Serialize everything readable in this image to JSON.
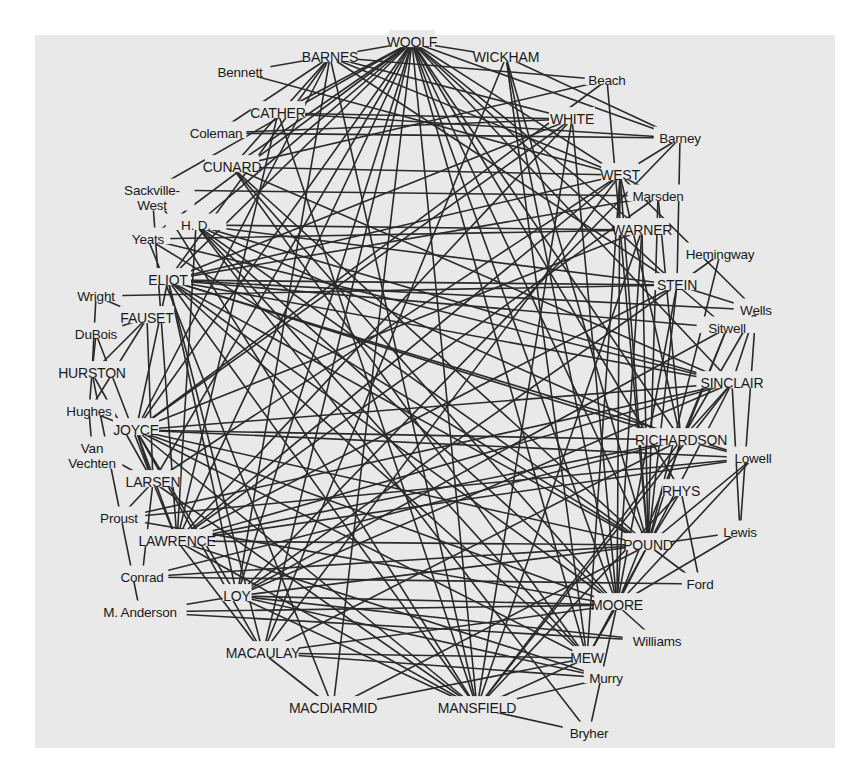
{
  "diagram": {
    "colors": {
      "background": "#ffffff",
      "panel": "#e9e9e9",
      "line": "#2a2a2a",
      "text": "#1a1a1a"
    },
    "nodes": [
      {
        "id": "woolf",
        "label": "WOOLF",
        "x": 412,
        "y": 42,
        "major": true
      },
      {
        "id": "barnes",
        "label": "BARNES",
        "x": 330,
        "y": 57,
        "major": true
      },
      {
        "id": "wickham",
        "label": "WICKHAM",
        "x": 506,
        "y": 57,
        "major": true
      },
      {
        "id": "bennett",
        "label": "Bennett",
        "x": 240,
        "y": 72,
        "major": false
      },
      {
        "id": "beach",
        "label": "Beach",
        "x": 607,
        "y": 80,
        "major": false
      },
      {
        "id": "cather",
        "label": "CATHER",
        "x": 278,
        "y": 113,
        "major": true
      },
      {
        "id": "white",
        "label": "WHITE",
        "x": 572,
        "y": 119,
        "major": true
      },
      {
        "id": "coleman",
        "label": "Coleman",
        "x": 216,
        "y": 133,
        "major": false
      },
      {
        "id": "barney",
        "label": "Barney",
        "x": 680,
        "y": 138,
        "major": false
      },
      {
        "id": "cunard",
        "label": "CUNARD",
        "x": 232,
        "y": 167,
        "major": true
      },
      {
        "id": "west",
        "label": "WEST",
        "x": 620,
        "y": 175,
        "major": true
      },
      {
        "id": "sackville",
        "label": "Sackville-",
        "label2": "West",
        "x": 152,
        "y": 190,
        "major": false
      },
      {
        "id": "marsden",
        "label": "Marsden",
        "x": 658,
        "y": 196,
        "major": false
      },
      {
        "id": "hd",
        "label": "H.   D.",
        "x": 196,
        "y": 225,
        "major": false
      },
      {
        "id": "warner",
        "label": "WARNER",
        "x": 642,
        "y": 230,
        "major": true
      },
      {
        "id": "yeats",
        "label": "Yeats",
        "x": 148,
        "y": 239,
        "major": false
      },
      {
        "id": "hemingway",
        "label": "Hemingway",
        "x": 720,
        "y": 254,
        "major": false
      },
      {
        "id": "eliot",
        "label": "ELIOT",
        "x": 168,
        "y": 280,
        "major": true
      },
      {
        "id": "stein",
        "label": "STEIN",
        "x": 677,
        "y": 285,
        "major": true
      },
      {
        "id": "wright",
        "label": "Wright",
        "x": 96,
        "y": 296,
        "major": false
      },
      {
        "id": "wells",
        "label": "Wells",
        "x": 756,
        "y": 310,
        "major": false
      },
      {
        "id": "fauset",
        "label": "FAUSET",
        "x": 147,
        "y": 318,
        "major": true
      },
      {
        "id": "sitwell",
        "label": "Sitwell",
        "x": 727,
        "y": 328,
        "major": false
      },
      {
        "id": "dubois",
        "label": "DuBois",
        "x": 96,
        "y": 334,
        "major": false
      },
      {
        "id": "hurston",
        "label": "HURSTON",
        "x": 92,
        "y": 373,
        "major": true
      },
      {
        "id": "sinclair",
        "label": "SINCLAIR",
        "x": 732,
        "y": 383,
        "major": true
      },
      {
        "id": "hughes",
        "label": "Hughes",
        "x": 89,
        "y": 411,
        "major": false
      },
      {
        "id": "joyce",
        "label": "JOYCE",
        "x": 136,
        "y": 430,
        "major": true
      },
      {
        "id": "richardson",
        "label": "RICHARDSON",
        "x": 681,
        "y": 440,
        "major": true
      },
      {
        "id": "van",
        "label": "Van",
        "label2": "Vechten",
        "x": 92,
        "y": 448,
        "major": false
      },
      {
        "id": "lowell",
        "label": "Lowell",
        "x": 753,
        "y": 458,
        "major": false
      },
      {
        "id": "larsen",
        "label": "LARSEN",
        "x": 153,
        "y": 482,
        "major": true
      },
      {
        "id": "rhys",
        "label": "RHYS",
        "x": 681,
        "y": 491,
        "major": true
      },
      {
        "id": "proust",
        "label": "Proust",
        "x": 119,
        "y": 518,
        "major": false
      },
      {
        "id": "lawrence",
        "label": "LAWRENCE",
        "x": 177,
        "y": 541,
        "major": true
      },
      {
        "id": "lewis",
        "label": "Lewis",
        "x": 740,
        "y": 532,
        "major": false
      },
      {
        "id": "pound",
        "label": "POUND",
        "x": 648,
        "y": 545,
        "major": true
      },
      {
        "id": "conrad",
        "label": "Conrad",
        "x": 142,
        "y": 577,
        "major": false
      },
      {
        "id": "ford",
        "label": "Ford",
        "x": 700,
        "y": 584,
        "major": false
      },
      {
        "id": "loy",
        "label": "LOY",
        "x": 237,
        "y": 596,
        "major": true
      },
      {
        "id": "anderson",
        "label": "M. Anderson",
        "x": 140,
        "y": 612,
        "major": false
      },
      {
        "id": "moore",
        "label": "MOORE",
        "x": 617,
        "y": 605,
        "major": true
      },
      {
        "id": "williams",
        "label": "Williams",
        "x": 657,
        "y": 641,
        "major": false
      },
      {
        "id": "macaulay",
        "label": "MACAULAY",
        "x": 263,
        "y": 653,
        "major": true
      },
      {
        "id": "mew",
        "label": "MEW",
        "x": 587,
        "y": 658,
        "major": true
      },
      {
        "id": "murry",
        "label": "Murry",
        "x": 606,
        "y": 678,
        "major": false
      },
      {
        "id": "macdiarmid",
        "label": "MACDIARMID",
        "x": 333,
        "y": 708,
        "major": true
      },
      {
        "id": "mansfield",
        "label": "MANSFIELD",
        "x": 477,
        "y": 708,
        "major": true
      },
      {
        "id": "bryher",
        "label": "Bryher",
        "x": 589,
        "y": 733,
        "major": false
      }
    ],
    "edges": [
      [
        "woolf",
        "bennett"
      ],
      [
        "woolf",
        "cather"
      ],
      [
        "woolf",
        "cunard"
      ],
      [
        "woolf",
        "eliot"
      ],
      [
        "woolf",
        "hd"
      ],
      [
        "woolf",
        "joyce"
      ],
      [
        "woolf",
        "lawrence"
      ],
      [
        "woolf",
        "larsen"
      ],
      [
        "woolf",
        "mansfield"
      ],
      [
        "woolf",
        "macaulay"
      ],
      [
        "woolf",
        "west"
      ],
      [
        "woolf",
        "warner"
      ],
      [
        "woolf",
        "sinclair"
      ],
      [
        "woolf",
        "richardson"
      ],
      [
        "woolf",
        "stein"
      ],
      [
        "woolf",
        "pound"
      ],
      [
        "woolf",
        "moore"
      ],
      [
        "woolf",
        "mew"
      ],
      [
        "woolf",
        "barney"
      ],
      [
        "woolf",
        "loy"
      ],
      [
        "woolf",
        "macdiarmid"
      ],
      [
        "woolf",
        "sackville"
      ],
      [
        "woolf",
        "yeats"
      ],
      [
        "woolf",
        "wickham"
      ],
      [
        "woolf",
        "rhys"
      ],
      [
        "barnes",
        "coleman"
      ],
      [
        "barnes",
        "eliot"
      ],
      [
        "barnes",
        "joyce"
      ],
      [
        "barnes",
        "loy"
      ],
      [
        "barnes",
        "cunard"
      ],
      [
        "barnes",
        "beach"
      ],
      [
        "barnes",
        "white"
      ],
      [
        "barnes",
        "west"
      ],
      [
        "barnes",
        "stein"
      ],
      [
        "barnes",
        "mansfield"
      ],
      [
        "wickham",
        "barney"
      ],
      [
        "wickham",
        "moore"
      ],
      [
        "wickham",
        "mew"
      ],
      [
        "wickham",
        "macaulay"
      ],
      [
        "wickham",
        "pound"
      ],
      [
        "bennett",
        "west"
      ],
      [
        "beach",
        "joyce"
      ],
      [
        "beach",
        "pound"
      ],
      [
        "beach",
        "cunard"
      ],
      [
        "cather",
        "white"
      ],
      [
        "cather",
        "barney"
      ],
      [
        "cather",
        "mansfield"
      ],
      [
        "cather",
        "lawrence"
      ],
      [
        "coleman",
        "barney"
      ],
      [
        "coleman",
        "white"
      ],
      [
        "white",
        "eliot"
      ],
      [
        "white",
        "lawrence"
      ],
      [
        "white",
        "moore"
      ],
      [
        "white",
        "joyce"
      ],
      [
        "white",
        "mansfield"
      ],
      [
        "barney",
        "west"
      ],
      [
        "barney",
        "stein"
      ],
      [
        "barney",
        "loy"
      ],
      [
        "cunard",
        "pound"
      ],
      [
        "cunard",
        "west"
      ],
      [
        "cunard",
        "moore"
      ],
      [
        "cunard",
        "sinclair"
      ],
      [
        "cunard",
        "mew"
      ],
      [
        "west",
        "marsden"
      ],
      [
        "west",
        "wells"
      ],
      [
        "west",
        "eliot"
      ],
      [
        "west",
        "lawrence"
      ],
      [
        "west",
        "larsen"
      ],
      [
        "west",
        "pound"
      ],
      [
        "west",
        "mew"
      ],
      [
        "west",
        "moore"
      ],
      [
        "west",
        "macaulay"
      ],
      [
        "west",
        "richardson"
      ],
      [
        "sackville",
        "lawrence"
      ],
      [
        "sackville",
        "marsden"
      ],
      [
        "sackville",
        "mansfield"
      ],
      [
        "marsden",
        "eliot"
      ],
      [
        "marsden",
        "lawrence"
      ],
      [
        "marsden",
        "pound"
      ],
      [
        "marsden",
        "richardson"
      ],
      [
        "hd",
        "warner"
      ],
      [
        "hd",
        "pound"
      ],
      [
        "hd",
        "lawrence"
      ],
      [
        "hd",
        "moore"
      ],
      [
        "hd",
        "bryher"
      ],
      [
        "hd",
        "stein"
      ],
      [
        "hd",
        "mew"
      ],
      [
        "hd",
        "richardson"
      ],
      [
        "hd",
        "sinclair"
      ],
      [
        "warner",
        "yeats"
      ],
      [
        "warner",
        "joyce"
      ],
      [
        "warner",
        "pound"
      ],
      [
        "warner",
        "mansfield"
      ],
      [
        "warner",
        "moore"
      ],
      [
        "hemingway",
        "stein"
      ],
      [
        "hemingway",
        "pound"
      ],
      [
        "yeats",
        "pound"
      ],
      [
        "yeats",
        "macdiarmid"
      ],
      [
        "yeats",
        "sinclair"
      ],
      [
        "eliot",
        "stein"
      ],
      [
        "eliot",
        "pound"
      ],
      [
        "eliot",
        "sinclair"
      ],
      [
        "eliot",
        "moore"
      ],
      [
        "eliot",
        "richardson"
      ],
      [
        "eliot",
        "mansfield"
      ],
      [
        "eliot",
        "macaulay"
      ],
      [
        "eliot",
        "loy"
      ],
      [
        "eliot",
        "sitwell"
      ],
      [
        "eliot",
        "wells"
      ],
      [
        "eliot",
        "mew"
      ],
      [
        "eliot",
        "joyce"
      ],
      [
        "eliot",
        "lowell"
      ],
      [
        "stein",
        "sitwell"
      ],
      [
        "stein",
        "wells"
      ],
      [
        "stein",
        "moore"
      ],
      [
        "stein",
        "pound"
      ],
      [
        "stein",
        "wright"
      ],
      [
        "stein",
        "lawrence"
      ],
      [
        "stein",
        "loy"
      ],
      [
        "wright",
        "fauset"
      ],
      [
        "wright",
        "hurston"
      ],
      [
        "wells",
        "richardson"
      ],
      [
        "wells",
        "sinclair"
      ],
      [
        "fauset",
        "dubois"
      ],
      [
        "fauset",
        "hughes"
      ],
      [
        "fauset",
        "hurston"
      ],
      [
        "fauset",
        "larsen"
      ],
      [
        "sitwell",
        "richardson"
      ],
      [
        "sitwell",
        "loy"
      ],
      [
        "sitwell",
        "moore"
      ],
      [
        "dubois",
        "hurston"
      ],
      [
        "dubois",
        "larsen"
      ],
      [
        "hurston",
        "hughes"
      ],
      [
        "hurston",
        "larsen"
      ],
      [
        "hurston",
        "anderson"
      ],
      [
        "sinclair",
        "richardson"
      ],
      [
        "sinclair",
        "lawrence"
      ],
      [
        "sinclair",
        "joyce"
      ],
      [
        "sinclair",
        "mansfield"
      ],
      [
        "sinclair",
        "loy"
      ],
      [
        "sinclair",
        "lewis"
      ],
      [
        "sinclair",
        "pound"
      ],
      [
        "sinclair",
        "proust"
      ],
      [
        "hughes",
        "van"
      ],
      [
        "hughes",
        "joyce"
      ],
      [
        "joyce",
        "larsen"
      ],
      [
        "joyce",
        "pound"
      ],
      [
        "joyce",
        "richardson"
      ],
      [
        "joyce",
        "lowell"
      ],
      [
        "joyce",
        "moore"
      ],
      [
        "joyce",
        "mansfield"
      ],
      [
        "joyce",
        "lawrence"
      ],
      [
        "joyce",
        "loy"
      ],
      [
        "joyce",
        "macaulay"
      ],
      [
        "joyce",
        "mew"
      ],
      [
        "richardson",
        "lowell"
      ],
      [
        "richardson",
        "lawrence"
      ],
      [
        "richardson",
        "pound"
      ],
      [
        "richardson",
        "conrad"
      ],
      [
        "richardson",
        "mansfield"
      ],
      [
        "richardson",
        "macaulay"
      ],
      [
        "van",
        "larsen"
      ],
      [
        "lowell",
        "pound"
      ],
      [
        "lowell",
        "moore"
      ],
      [
        "lowell",
        "lawrence"
      ],
      [
        "larsen",
        "proust"
      ],
      [
        "larsen",
        "conrad"
      ],
      [
        "larsen",
        "lawrence"
      ],
      [
        "larsen",
        "mansfield"
      ],
      [
        "rhys",
        "pound"
      ],
      [
        "rhys",
        "ford"
      ],
      [
        "rhys",
        "mansfield"
      ],
      [
        "proust",
        "lowell"
      ],
      [
        "proust",
        "moore"
      ],
      [
        "lawrence",
        "pound"
      ],
      [
        "lawrence",
        "mansfield"
      ],
      [
        "lawrence",
        "murry"
      ],
      [
        "lawrence",
        "macaulay"
      ],
      [
        "lewis",
        "pound"
      ],
      [
        "lewis",
        "wells"
      ],
      [
        "lewis",
        "moore"
      ],
      [
        "pound",
        "ford"
      ],
      [
        "pound",
        "moore"
      ],
      [
        "pound",
        "loy"
      ],
      [
        "pound",
        "mew"
      ],
      [
        "pound",
        "macdiarmid"
      ],
      [
        "conrad",
        "ford"
      ],
      [
        "conrad",
        "pound"
      ],
      [
        "loy",
        "anderson"
      ],
      [
        "loy",
        "moore"
      ],
      [
        "loy",
        "williams"
      ],
      [
        "loy",
        "mansfield"
      ],
      [
        "loy",
        "murry"
      ],
      [
        "anderson",
        "moore"
      ],
      [
        "anderson",
        "williams"
      ],
      [
        "moore",
        "williams"
      ],
      [
        "moore",
        "bryher"
      ],
      [
        "moore",
        "mew"
      ],
      [
        "moore",
        "macaulay"
      ],
      [
        "macaulay",
        "murry"
      ],
      [
        "macaulay",
        "mew"
      ],
      [
        "macaulay",
        "macdiarmid"
      ],
      [
        "mew",
        "mansfield"
      ],
      [
        "murry",
        "mansfield"
      ],
      [
        "mansfield",
        "bryher"
      ],
      [
        "macdiarmid",
        "mew"
      ]
    ]
  }
}
